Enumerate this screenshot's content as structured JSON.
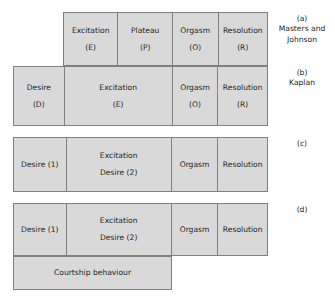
{
  "figure": {
    "fill_color": "#d9d9d9",
    "border_color": "#808080",
    "text_color": "#231f20",
    "background_color": "#ffffff"
  },
  "rows": [
    {
      "id": "a",
      "caption_tag": "(a)",
      "caption_who": "Masters and Johnson",
      "cells": [
        {
          "line1": "Excitation",
          "line2": "(E)",
          "width": 54
        },
        {
          "line1": "Plateau",
          "line2": "(P)",
          "width": 55
        },
        {
          "line1": "Orgasm",
          "line2": "(O)",
          "width": 46
        },
        {
          "line1": "Resolution",
          "line2": "(R)",
          "width": 50
        }
      ]
    },
    {
      "id": "b",
      "caption_tag": "(b)",
      "caption_who": "Kaplan",
      "cells": [
        {
          "line1": "Desire",
          "line2": "(D)",
          "width": 50
        },
        {
          "line1": "Excitation",
          "line2": "(E)",
          "width": 109
        },
        {
          "line1": "Orgasm",
          "line2": "(O)",
          "width": 46
        },
        {
          "line1": "Resolution",
          "line2": "(R)",
          "width": 50
        }
      ]
    },
    {
      "id": "c",
      "caption_tag": "(c)",
      "caption_who": "",
      "cells": [
        {
          "line1": "Desire (1)",
          "line2": "",
          "width": 52
        },
        {
          "line1": "Excitation",
          "line2": "Desire (2)",
          "width": 106
        },
        {
          "line1": "Orgasm",
          "line2": "",
          "width": 47
        },
        {
          "line1": "Resolution",
          "line2": "",
          "width": 50
        }
      ]
    },
    {
      "id": "d",
      "caption_tag": "(d)",
      "caption_who": "",
      "cells": [
        {
          "line1": "Desire (1)",
          "line2": "",
          "width": 52
        },
        {
          "line1": "Excitation",
          "line2": "Desire (2)",
          "width": 106
        },
        {
          "line1": "Orgasm",
          "line2": "",
          "width": 47
        },
        {
          "line1": "Resolution",
          "line2": "",
          "width": 50
        }
      ]
    }
  ],
  "courtship": {
    "label": "Courtship behaviour"
  }
}
